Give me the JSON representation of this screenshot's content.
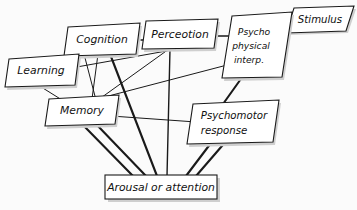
{
  "diagram": {
    "style": {
      "node_fill": "#ffffff",
      "node_stroke": "#1a1a1a",
      "shadow": "#cfcfcf",
      "background": "#fbfbfb",
      "text_color": "#111111"
    },
    "nodes": [
      {
        "id": "cognition",
        "label": "Cognition",
        "lines": [
          "Cognition"
        ],
        "shape": "parallelogram",
        "cx": 102,
        "cy": 41
      },
      {
        "id": "perceotion",
        "label": "Perceotion",
        "lines": [
          "Perceotion"
        ],
        "shape": "parallelogram",
        "cx": 177,
        "cy": 35
      },
      {
        "id": "psychophysical",
        "label": "Psycho physical interp.",
        "lines": [
          "Psycho",
          "physical",
          "interp."
        ],
        "shape": "parallelogram",
        "cx": 253,
        "cy": 44
      },
      {
        "id": "stimulus",
        "label": "Stimulus",
        "lines": [
          "Stimulus"
        ],
        "shape": "parallelogram",
        "cx": 320,
        "cy": 20
      },
      {
        "id": "learning",
        "label": "Learning",
        "lines": [
          "Learning"
        ],
        "shape": "parallelogram",
        "cx": 41,
        "cy": 72
      },
      {
        "id": "memory",
        "label": "Memory",
        "lines": [
          "Memory"
        ],
        "shape": "parallelogram",
        "cx": 81,
        "cy": 110
      },
      {
        "id": "psychomotor",
        "label": "Psychomotor response",
        "lines": [
          "Psychomotor",
          "response"
        ],
        "shape": "parallelogram",
        "cx": 230,
        "cy": 121
      },
      {
        "id": "arousal",
        "label": "Arousal or attention",
        "lines": [
          "Arousal or attention"
        ],
        "shape": "rectangle",
        "cx": 163,
        "cy": 189
      }
    ],
    "edges": [
      {
        "id": "stimulus-psychophysical",
        "from": "stimulus",
        "to": "psychophysical",
        "weight": "medium"
      },
      {
        "id": "psychophysical-perceotion",
        "from": "psychophysical",
        "to": "perceotion",
        "weight": "medium"
      },
      {
        "id": "psychophysical-psychomotor",
        "from": "psychophysical",
        "to": "psychomotor",
        "weight": "thick"
      },
      {
        "id": "perceotion-cognition",
        "from": "perceotion",
        "to": "cognition",
        "weight": "medium"
      },
      {
        "id": "perceotion-arousal",
        "from": "perceotion",
        "to": "arousal",
        "weight": "medium"
      },
      {
        "id": "perceotion-memory",
        "from": "perceotion",
        "to": "memory",
        "weight": "thin"
      },
      {
        "id": "psychophysical-memory",
        "from": "psychophysical",
        "to": "memory",
        "weight": "thin"
      },
      {
        "id": "cognition-learning",
        "from": "cognition",
        "to": "learning",
        "weight": "thin"
      },
      {
        "id": "cognition-memory",
        "from": "cognition",
        "to": "memory",
        "weight": "thin"
      },
      {
        "id": "cognition-memory-2",
        "from": "cognition",
        "to": "memory",
        "weight": "thin"
      },
      {
        "id": "cognition-arousal",
        "from": "cognition",
        "to": "arousal",
        "weight": "thick"
      },
      {
        "id": "learning-memory",
        "from": "learning",
        "to": "memory",
        "weight": "thin"
      },
      {
        "id": "learning-perceotion",
        "from": "learning",
        "to": "perceotion",
        "weight": "thin"
      },
      {
        "id": "memory-psychomotor",
        "from": "memory",
        "to": "psychomotor",
        "weight": "thin"
      },
      {
        "id": "memory-arousal-1",
        "from": "memory",
        "to": "arousal",
        "weight": "thick"
      },
      {
        "id": "memory-arousal-2",
        "from": "memory",
        "to": "arousal",
        "weight": "thick"
      },
      {
        "id": "psychomotor-arousal",
        "from": "psychomotor",
        "to": "arousal",
        "weight": "thick"
      }
    ]
  }
}
